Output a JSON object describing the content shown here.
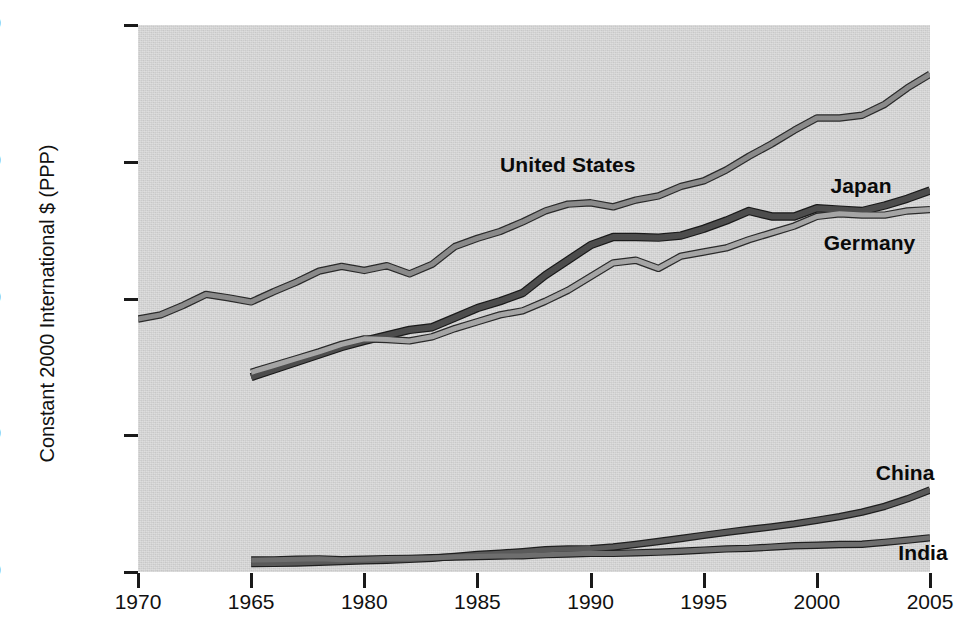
{
  "chart_data": {
    "type": "line",
    "title": "",
    "subtitle": "",
    "xlabel": "",
    "ylabel": "Constant 2000 International $ (PPP)",
    "xlim": [
      1970,
      2005
    ],
    "ylim": [
      0,
      40000
    ],
    "grid": false,
    "legend_position": "inline-labels",
    "x_tick_labels": [
      "1970",
      "1965",
      "1980",
      "1985",
      "1990",
      "1995",
      "2000",
      "2005"
    ],
    "x_tick_values": [
      1970,
      1975,
      1980,
      1985,
      1990,
      1995,
      2000,
      2005
    ],
    "y_tick_labels": [
      "40,000",
      "30,000",
      "20,000",
      "10,000",
      "0"
    ],
    "y_tick_values": [
      40000,
      30000,
      20000,
      10000,
      0
    ],
    "annotations": [
      {
        "text": "United States",
        "x": 1986.0,
        "y": 29600
      },
      {
        "text": "Japan",
        "x": 2000.6,
        "y": 28100
      },
      {
        "text": "Germany",
        "x": 2000.3,
        "y": 23900
      },
      {
        "text": "China",
        "x": 2002.6,
        "y": 7100
      },
      {
        "text": "India",
        "x": 2003.6,
        "y": 1250
      }
    ],
    "series": [
      {
        "name": "United States",
        "color": "#8a8a8a",
        "edge_color": "#2a2a2a",
        "line_width": 5,
        "x": [
          1970,
          1971,
          1972,
          1973,
          1974,
          1975,
          1976,
          1977,
          1978,
          1979,
          1980,
          1981,
          1982,
          1983,
          1984,
          1985,
          1986,
          1987,
          1988,
          1989,
          1990,
          1991,
          1992,
          1993,
          1994,
          1995,
          1996,
          1997,
          1998,
          1999,
          2000,
          2001,
          2002,
          2003,
          2004,
          2005
        ],
        "values": [
          18500,
          18800,
          19500,
          20300,
          20050,
          19750,
          20500,
          21200,
          22000,
          22350,
          22050,
          22400,
          21800,
          22500,
          23800,
          24400,
          24900,
          25600,
          26400,
          26900,
          27000,
          26700,
          27200,
          27500,
          28200,
          28600,
          29400,
          30400,
          31300,
          32300,
          33200,
          33200,
          33400,
          34200,
          35400,
          36400
        ]
      },
      {
        "name": "Japan",
        "color": "#4d4d4d",
        "edge_color": "#1a1a1a",
        "line_width": 6,
        "x": [
          1975,
          1976,
          1977,
          1978,
          1979,
          1980,
          1981,
          1982,
          1983,
          1984,
          1985,
          1986,
          1987,
          1988,
          1989,
          1990,
          1991,
          1992,
          1993,
          1994,
          1995,
          1996,
          1997,
          1998,
          1999,
          2000,
          2001,
          2002,
          2003,
          2004,
          2005
        ],
        "values": [
          14250,
          14800,
          15350,
          15900,
          16450,
          16900,
          17300,
          17700,
          17900,
          18600,
          19300,
          19800,
          20400,
          21700,
          22800,
          23900,
          24500,
          24500,
          24450,
          24600,
          25100,
          25700,
          26400,
          26000,
          26000,
          26600,
          26500,
          26400,
          26800,
          27300,
          27900
        ]
      },
      {
        "name": "Germany",
        "color": "#a5a5a5",
        "edge_color": "#2a2a2a",
        "line_width": 5,
        "x": [
          1975,
          1976,
          1977,
          1978,
          1979,
          1980,
          1981,
          1982,
          1983,
          1984,
          1985,
          1986,
          1987,
          1988,
          1989,
          1990,
          1991,
          1992,
          1993,
          1994,
          1995,
          1996,
          1997,
          1998,
          1999,
          2000,
          2001,
          2002,
          2003,
          2004,
          2005
        ],
        "values": [
          14600,
          15100,
          15600,
          16100,
          16650,
          17050,
          17000,
          16900,
          17200,
          17800,
          18300,
          18800,
          19100,
          19800,
          20600,
          21600,
          22600,
          22800,
          22200,
          23100,
          23400,
          23700,
          24300,
          24800,
          25300,
          26000,
          26200,
          26100,
          26100,
          26400,
          26500
        ]
      },
      {
        "name": "China",
        "color": "#5a5a5a",
        "edge_color": "#1f1f1f",
        "line_width": 5,
        "x": [
          1975,
          1976,
          1977,
          1978,
          1979,
          1980,
          1981,
          1982,
          1983,
          1984,
          1985,
          1986,
          1987,
          1988,
          1989,
          1990,
          1991,
          1992,
          1993,
          1994,
          1995,
          1996,
          1997,
          1998,
          1999,
          2000,
          2001,
          2002,
          2003,
          2004,
          2005
        ],
        "values": [
          620,
          630,
          660,
          710,
          760,
          820,
          860,
          920,
          1010,
          1140,
          1280,
          1370,
          1490,
          1630,
          1680,
          1710,
          1830,
          2020,
          2230,
          2450,
          2680,
          2900,
          3110,
          3300,
          3520,
          3780,
          4050,
          4380,
          4800,
          5350,
          6000
        ]
      },
      {
        "name": "India",
        "color": "#6e6e6e",
        "edge_color": "#1f1f1f",
        "line_width": 5,
        "x": [
          1975,
          1976,
          1977,
          1978,
          1979,
          1980,
          1981,
          1982,
          1983,
          1984,
          1985,
          1986,
          1987,
          1988,
          1989,
          1990,
          1991,
          1992,
          1993,
          1994,
          1995,
          1996,
          1997,
          1998,
          1999,
          2000,
          2001,
          2002,
          2003,
          2004,
          2005
        ],
        "values": [
          880,
          890,
          930,
          960,
          900,
          940,
          980,
          1000,
          1050,
          1090,
          1130,
          1170,
          1190,
          1270,
          1320,
          1370,
          1360,
          1400,
          1450,
          1520,
          1600,
          1690,
          1730,
          1820,
          1920,
          1960,
          2010,
          2030,
          2170,
          2330,
          2500
        ]
      }
    ]
  },
  "axis": {
    "y_title": "Constant 2000 International $ (PPP)"
  }
}
